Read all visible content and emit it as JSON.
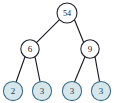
{
  "figure": {
    "kind": "binary-tree-diagram",
    "background_color": "#ffffff",
    "edge_color": "#1b1b26",
    "internal_node_fill": "#ffffff",
    "internal_node_stroke": "#23232e",
    "leaf_node_fill": "#d5e6ed",
    "leaf_node_stroke": "#3c6b80",
    "leaf_label_color": "#1e3d4d"
  },
  "nodes": [
    {
      "id": "root",
      "label": "54",
      "cx": 67,
      "cy": 13,
      "r": 10.0,
      "type": "internal",
      "level": 0
    },
    {
      "id": "n-l",
      "label": "6",
      "cx": 30,
      "cy": 49,
      "r": 9.2,
      "type": "internal",
      "level": 1
    },
    {
      "id": "n-r",
      "label": "9",
      "cx": 90,
      "cy": 49,
      "r": 9.2,
      "type": "internal",
      "level": 1
    },
    {
      "id": "leaf-1",
      "label": "2",
      "cx": 13,
      "cy": 91,
      "r": 9.6,
      "type": "leaf",
      "level": 2
    },
    {
      "id": "leaf-2",
      "label": "3",
      "cx": 42,
      "cy": 91,
      "r": 9.6,
      "type": "leaf",
      "level": 2
    },
    {
      "id": "leaf-3",
      "label": "3",
      "cx": 72,
      "cy": 91,
      "r": 9.6,
      "type": "leaf",
      "level": 2
    },
    {
      "id": "leaf-4",
      "label": "3",
      "cx": 101,
      "cy": 91,
      "r": 9.6,
      "type": "leaf",
      "level": 2
    }
  ],
  "edges": [
    {
      "id": "e-root-left",
      "from": "root",
      "to": "n-l",
      "x1": 59.5,
      "y1": 19.7,
      "x2": 36.2,
      "y2": 42.8
    },
    {
      "id": "e-root-right",
      "from": "root",
      "to": "n-r",
      "x1": 74.5,
      "y1": 19.7,
      "x2": 83.8,
      "y2": 42.8
    },
    {
      "id": "e-l-leaf1",
      "from": "n-l",
      "to": "leaf-1",
      "x1": 25.0,
      "y1": 56.7,
      "x2": 16.1,
      "y2": 82.0
    },
    {
      "id": "e-l-leaf2",
      "from": "n-l",
      "to": "leaf-2",
      "x1": 35.0,
      "y1": 56.7,
      "x2": 40.0,
      "y2": 81.5
    },
    {
      "id": "e-r-leaf3",
      "from": "n-r",
      "to": "leaf-3",
      "x1": 85.0,
      "y1": 56.7,
      "x2": 74.5,
      "y2": 82.0
    },
    {
      "id": "e-r-leaf4",
      "from": "n-r",
      "to": "leaf-4",
      "x1": 95.0,
      "y1": 56.7,
      "x2": 99.5,
      "y2": 81.5
    }
  ]
}
